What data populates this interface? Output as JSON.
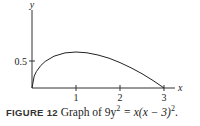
{
  "chart_data": {
    "type": "line",
    "title": "",
    "xlabel": "x",
    "ylabel": "y",
    "x_ticks": [
      "1",
      "2",
      "3"
    ],
    "y_ticks": [
      "0.5"
    ],
    "xlim": [
      0,
      3.3
    ],
    "ylim": [
      0,
      1.5
    ],
    "grid": false,
    "series": [
      {
        "name": "9y^2 = x(x-3)^2 (upper branch)",
        "x": [
          0,
          0.05,
          0.1,
          0.2,
          0.3,
          0.5,
          0.75,
          1.0,
          1.25,
          1.5,
          1.75,
          2.0,
          2.25,
          2.5,
          2.75,
          3.0
        ],
        "values": [
          0,
          0.221,
          0.305,
          0.417,
          0.493,
          0.589,
          0.65,
          0.667,
          0.652,
          0.612,
          0.551,
          0.471,
          0.375,
          0.264,
          0.138,
          0
        ]
      }
    ]
  },
  "axes": {
    "x_label": "x",
    "y_label": "y",
    "x_tick_labels": [
      "1",
      "2",
      "3"
    ],
    "y_tick_labels": [
      "0.5"
    ]
  },
  "caption": {
    "label": "FIGURE 12",
    "text": "Graph of 9y",
    "exp1": "2",
    "mid": " = x(x − 3)",
    "exp2": "2",
    "end": "."
  }
}
